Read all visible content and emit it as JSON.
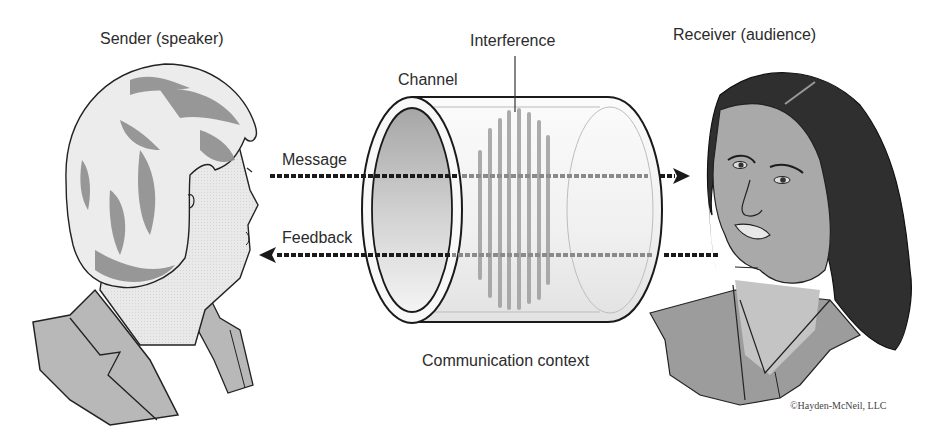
{
  "diagram": {
    "type": "communication-model",
    "labels": {
      "sender": "Sender (speaker)",
      "interference": "Interference",
      "channel": "Channel",
      "receiver": "Receiver (audience)",
      "message": "Message",
      "feedback": "Feedback",
      "context": "Communication context"
    },
    "credit": "©Hayden-McNeil, LLC",
    "arrows": [
      {
        "name": "message",
        "from": "sender",
        "to": "receiver",
        "direction": "right"
      },
      {
        "name": "feedback",
        "from": "receiver",
        "to": "sender",
        "direction": "left"
      }
    ],
    "colors": {
      "line": "#1a1a1a",
      "hair_sender": "#8a8a8a",
      "skin": "#e6e6e6",
      "jacket": "#b4b4b4",
      "hair_receiver": "#2f2f2f",
      "skin_receiver": "#a8a8a8",
      "interference": "#9a9a9a"
    }
  }
}
